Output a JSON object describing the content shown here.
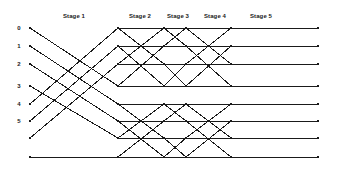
{
  "figure": {
    "background_color": "#ffffff",
    "line_color": "#1a1a1a",
    "node_color": "#1a1a1a",
    "width": 338,
    "height": 170
  },
  "stage_labels": [
    {
      "text": "Stage 1",
      "x": 74,
      "y": 13
    },
    {
      "text": "Stage 2",
      "x": 140,
      "y": 13
    },
    {
      "text": "Stage 3",
      "x": 178,
      "y": 13
    },
    {
      "text": "Stage 4",
      "x": 215,
      "y": 13
    },
    {
      "text": "Stage 5",
      "x": 261,
      "y": 13
    }
  ],
  "row_labels": [
    {
      "text": "0",
      "x": 19,
      "y": 28
    },
    {
      "text": "1",
      "x": 19,
      "y": 46
    },
    {
      "text": "2",
      "x": 19,
      "y": 64
    },
    {
      "text": "3",
      "x": 19,
      "y": 86
    },
    {
      "text": "4",
      "x": 19,
      "y": 104
    },
    {
      "text": "5",
      "x": 19,
      "y": 121
    }
  ],
  "chart_data": {
    "type": "diagram",
    "stages": 5,
    "rows": 8,
    "node_columns_x": [
      30,
      118,
      164,
      186,
      231,
      318
    ],
    "row_y": [
      28,
      46,
      64,
      86,
      104,
      121,
      138,
      157
    ],
    "node_size": 2.6,
    "edges": [
      {
        "stage": 1,
        "from_col": 0,
        "to_col": 1,
        "pairs": [
          [
            0,
            3
          ],
          [
            1,
            4
          ],
          [
            2,
            5
          ],
          [
            3,
            6
          ],
          [
            4,
            0
          ],
          [
            5,
            1
          ],
          [
            6,
            2
          ],
          [
            7,
            7
          ]
        ]
      },
      {
        "stage": 2,
        "from_col": 1,
        "to_col": 2,
        "pairs": [
          [
            0,
            0
          ],
          [
            0,
            2
          ],
          [
            1,
            1
          ],
          [
            1,
            3
          ],
          [
            2,
            0
          ],
          [
            2,
            2
          ],
          [
            3,
            1
          ],
          [
            3,
            3
          ],
          [
            4,
            4
          ],
          [
            4,
            6
          ],
          [
            5,
            5
          ],
          [
            5,
            7
          ],
          [
            6,
            4
          ],
          [
            6,
            6
          ],
          [
            7,
            5
          ],
          [
            7,
            7
          ]
        ]
      },
      {
        "stage": 3,
        "from_col": 2,
        "to_col": 3,
        "pairs": [
          [
            0,
            0
          ],
          [
            0,
            1
          ],
          [
            1,
            0
          ],
          [
            1,
            1
          ],
          [
            2,
            2
          ],
          [
            2,
            3
          ],
          [
            3,
            2
          ],
          [
            3,
            3
          ],
          [
            4,
            4
          ],
          [
            4,
            5
          ],
          [
            5,
            4
          ],
          [
            5,
            5
          ],
          [
            6,
            6
          ],
          [
            6,
            7
          ],
          [
            7,
            6
          ],
          [
            7,
            7
          ]
        ]
      },
      {
        "stage": 4,
        "from_col": 3,
        "to_col": 4,
        "pairs": [
          [
            0,
            0
          ],
          [
            0,
            2
          ],
          [
            1,
            1
          ],
          [
            1,
            3
          ],
          [
            2,
            0
          ],
          [
            2,
            2
          ],
          [
            3,
            1
          ],
          [
            3,
            3
          ],
          [
            4,
            4
          ],
          [
            4,
            6
          ],
          [
            5,
            5
          ],
          [
            5,
            7
          ],
          [
            6,
            4
          ],
          [
            6,
            6
          ],
          [
            7,
            5
          ],
          [
            7,
            7
          ]
        ]
      },
      {
        "stage": 5,
        "from_col": 4,
        "to_col": 5,
        "pairs": [
          [
            0,
            0
          ],
          [
            1,
            1
          ],
          [
            2,
            2
          ],
          [
            3,
            3
          ],
          [
            4,
            4
          ],
          [
            5,
            5
          ],
          [
            6,
            6
          ],
          [
            7,
            7
          ]
        ]
      }
    ]
  }
}
